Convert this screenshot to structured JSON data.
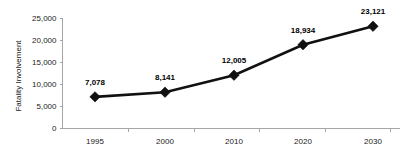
{
  "chart_data": {
    "type": "line",
    "title": "",
    "xlabel": "",
    "ylabel": "Fatality Involvement",
    "categories": [
      "1995",
      "2000",
      "2010",
      "2020",
      "2030"
    ],
    "values": [
      7078,
      8141,
      12005,
      18934,
      23121
    ],
    "data_labels": [
      "7,078",
      "8,141",
      "12,005",
      "18,934",
      "23,121"
    ],
    "series": [
      {
        "name": "Fatality Involvement",
        "values": [
          7078,
          8141,
          12005,
          18934,
          23121
        ]
      }
    ],
    "ylim": [
      0,
      25000
    ],
    "ytick_values": [
      0,
      5000,
      10000,
      15000,
      20000,
      25000
    ],
    "ytick_labels": [
      "0",
      "5,000",
      "10,000",
      "15,000",
      "20,000",
      "25,000"
    ],
    "xtick_labels": [
      "1995",
      "2000",
      "2010",
      "2020",
      "2030"
    ],
    "grid": false,
    "legend": false,
    "legend_position": "none",
    "marker": "diamond",
    "line_color": "#111111",
    "marker_color": "#111111",
    "axis_color": "#a6a6a6",
    "text_color": "#1a1a1a",
    "background_color": "#ffffff"
  }
}
